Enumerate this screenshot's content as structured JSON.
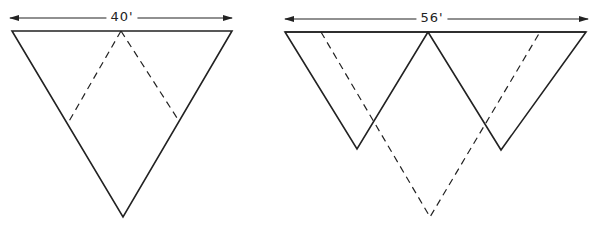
{
  "diagram": {
    "stroke_color": "#222222",
    "background": "#ffffff",
    "left_figure": {
      "dimension_label": "40'",
      "label_pos": [
        122,
        17
      ],
      "arrow": {
        "x1": 10,
        "x2": 232,
        "y": 18
      },
      "solid_triangle": [
        [
          12,
          31
        ],
        [
          232,
          31
        ],
        [
          123,
          217
        ]
      ],
      "dashed_lines": [
        [
          [
            121,
            31
          ],
          [
            68,
            123
          ]
        ],
        [
          [
            121,
            31
          ],
          [
            179,
            121
          ]
        ]
      ]
    },
    "right_figure": {
      "dimension_label": "56'",
      "label_pos": [
        432,
        18
      ],
      "arrow": {
        "x1": 285,
        "x2": 588,
        "y": 19
      },
      "top_line": [
        [
          285,
          32
        ],
        [
          586,
          32
        ]
      ],
      "solid_triangles": [
        [
          [
            285,
            32
          ],
          [
            428,
            32
          ],
          [
            357,
            149
          ]
        ],
        [
          [
            428,
            32
          ],
          [
            586,
            32
          ],
          [
            501,
            150
          ]
        ]
      ],
      "dashed_triangle": [
        [
          321,
          32
        ],
        [
          540,
          32
        ],
        [
          430,
          217
        ]
      ]
    }
  }
}
